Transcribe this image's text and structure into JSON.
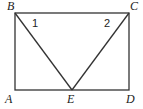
{
  "diagram": {
    "type": "geometry",
    "shape": "rectangle ABCD with point E on AD, segments BE and CE",
    "points": [
      {
        "name": "B",
        "x": 15,
        "y": 13,
        "label_x": 7,
        "label_y": 10
      },
      {
        "name": "C",
        "x": 129,
        "y": 13,
        "label_x": 130,
        "label_y": 10
      },
      {
        "name": "A",
        "x": 15,
        "y": 90,
        "label_x": 5,
        "label_y": 103
      },
      {
        "name": "E",
        "x": 72,
        "y": 90,
        "label_x": 67,
        "label_y": 103
      },
      {
        "name": "D",
        "x": 129,
        "y": 90,
        "label_x": 126,
        "label_y": 103
      }
    ],
    "angle_labels": [
      {
        "text": "1",
        "x": 32,
        "y": 27
      },
      {
        "text": "2",
        "x": 104,
        "y": 27
      }
    ]
  }
}
